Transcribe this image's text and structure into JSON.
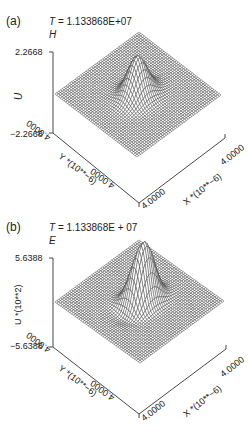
{
  "figure": {
    "panels": [
      {
        "label": "(a)",
        "time_prefix": "T",
        "time_value": "= 1.133868E+07",
        "variable": "H",
        "z_max": "2.2668",
        "z_min": "−2.2668",
        "z_axis_label": "U",
        "y_axis_start": "4.0000",
        "y_axis_end": "4.0000",
        "y_axis_label": "Y *(10**−6)",
        "x_axis_start": "4.0000",
        "x_axis_end": "4.0000",
        "x_axis_label": "X *(10**−6)"
      },
      {
        "label": "(b)",
        "time_prefix": "T",
        "time_value": "= 1.133868E + 07",
        "variable": "E",
        "z_max": "5.6388",
        "z_min": "−5.6388",
        "z_axis_label": "U *(10**2)",
        "y_axis_start": "4.0000",
        "y_axis_end": "4.0000",
        "y_axis_label": "Y *(10**−6)",
        "x_axis_start": "4.0000",
        "x_axis_end": "4.0000",
        "x_axis_label": "X *(10**−6)"
      }
    ]
  },
  "chart_data": [
    {
      "type": "surface",
      "title": "T = 1.133868E+07  H",
      "xlabel": "X *(10**-6)",
      "ylabel": "Y *(10**-6)",
      "zlabel": "U",
      "xlim": [
        -4.0,
        4.0
      ],
      "ylim": [
        -4.0,
        4.0
      ],
      "zlim": [
        -2.2668,
        2.2668
      ],
      "description": "Wireframe mesh surface on a flat plane with a single localized ridge-shaped peak near the center; amplitude peaks near the upper z limit with small dips at its flanks",
      "peak": {
        "x": 0.0,
        "y": 0.0,
        "value": 2.2668
      }
    },
    {
      "type": "surface",
      "title": "T = 1.133868E + 07  E",
      "xlabel": "X *(10**-6)",
      "ylabel": "Y *(10**-6)",
      "zlabel": "U *(10**2)",
      "xlim": [
        -4.0,
        4.0
      ],
      "ylim": [
        -4.0,
        4.0
      ],
      "zlim": [
        -5.6388,
        5.6388
      ],
      "description": "Wireframe mesh surface on a flat plane with a tall localized peak near the center and a secondary rounded lobe; small depressions around its base",
      "peak": {
        "x": 0.0,
        "y": 0.0,
        "value": 5.6388
      }
    }
  ],
  "render": {
    "grid_n": 46,
    "line_color": "#3a3a3a",
    "surface_fill": "#ffffff"
  }
}
